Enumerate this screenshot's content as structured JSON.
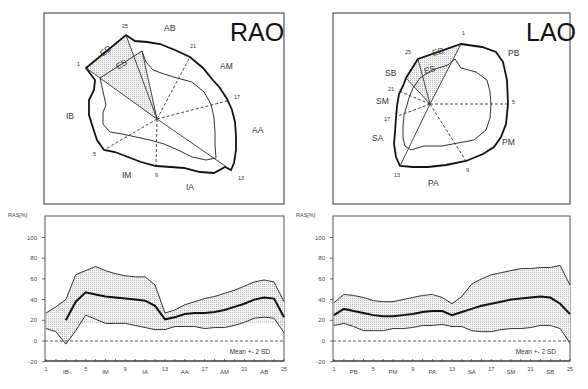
{
  "panels": {
    "rao": {
      "title": "RAO",
      "regions": [
        {
          "label": "AB",
          "x": 164,
          "y": 31
        },
        {
          "label": "AM",
          "x": 220,
          "y": 69
        },
        {
          "label": "AA",
          "x": 252,
          "y": 133
        },
        {
          "label": "IA",
          "x": 186,
          "y": 190
        },
        {
          "label": "IM",
          "x": 122,
          "y": 178
        },
        {
          "label": "IB",
          "x": 66,
          "y": 119
        }
      ],
      "point_labels": [
        {
          "label": "25",
          "x": 122,
          "y": 28
        },
        {
          "label": "21",
          "x": 190,
          "y": 48
        },
        {
          "label": "17",
          "x": 234,
          "y": 99
        },
        {
          "label": "13",
          "x": 238,
          "y": 180
        },
        {
          "label": "9",
          "x": 155,
          "y": 177
        },
        {
          "label": "5",
          "x": 93,
          "y": 156
        },
        {
          "label": "1",
          "x": 77,
          "y": 66
        }
      ],
      "ed_label": "ED",
      "es_label": "ES"
    },
    "lao": {
      "title": "LAO",
      "regions": [
        {
          "label": "PB",
          "x": 508,
          "y": 56
        },
        {
          "label": "PM",
          "x": 502,
          "y": 145
        },
        {
          "label": "PA",
          "x": 428,
          "y": 186
        },
        {
          "label": "SA",
          "x": 372,
          "y": 141
        },
        {
          "label": "SM",
          "x": 376,
          "y": 104
        },
        {
          "label": "SB",
          "x": 385,
          "y": 76
        }
      ],
      "point_labels": [
        {
          "label": "1",
          "x": 462,
          "y": 35
        },
        {
          "label": "25",
          "x": 405,
          "y": 54
        },
        {
          "label": "21",
          "x": 388,
          "y": 91
        },
        {
          "label": "17",
          "x": 384,
          "y": 121
        },
        {
          "label": "13",
          "x": 394,
          "y": 177
        },
        {
          "label": "9",
          "x": 466,
          "y": 172
        },
        {
          "label": "5",
          "x": 512,
          "y": 104
        }
      ],
      "ed_label": "ED",
      "es_label": "ES"
    }
  },
  "chart_data": [
    {
      "type": "area",
      "title": "RAO",
      "ylabel": "RAS[%]",
      "xlabel": "",
      "x": [
        1,
        2,
        3,
        4,
        5,
        6,
        7,
        8,
        9,
        10,
        11,
        12,
        13,
        14,
        15,
        16,
        17,
        18,
        19,
        20,
        21,
        22,
        23,
        24,
        25
      ],
      "x_tick_labels": [
        "1",
        "5",
        "9",
        "13",
        "17",
        "21",
        "25"
      ],
      "x_region_labels": [
        "IB",
        "IM",
        "IA",
        "AA",
        "AM",
        "AB"
      ],
      "ylim": [
        -20,
        100
      ],
      "y_ticks": [
        100,
        80,
        60,
        40,
        20,
        0,
        -20
      ],
      "reference_line": 0,
      "legend": "Mean +- 2 SD",
      "series": [
        {
          "name": "Mean + 2 SD",
          "values": [
            27,
            33,
            40,
            64,
            68,
            72,
            68,
            65,
            63,
            62,
            62,
            54,
            27,
            30,
            35,
            38,
            41,
            43,
            46,
            49,
            53,
            57,
            59,
            57,
            38
          ]
        },
        {
          "name": "Mean",
          "values": [
            null,
            null,
            20,
            38,
            47,
            45,
            43,
            42,
            41,
            40,
            39,
            34,
            21,
            23,
            26,
            27,
            27,
            28,
            30,
            33,
            36,
            40,
            42,
            41,
            23
          ]
        },
        {
          "name": "Mean - 2 SD",
          "values": [
            12,
            9,
            -3,
            10,
            25,
            21,
            17,
            17,
            17,
            15,
            13,
            11,
            11,
            14,
            14,
            14,
            12,
            13,
            13,
            15,
            18,
            22,
            23,
            22,
            8
          ]
        }
      ]
    },
    {
      "type": "area",
      "title": "LAO",
      "ylabel": "RAS[%]",
      "xlabel": "",
      "x": [
        1,
        2,
        3,
        4,
        5,
        6,
        7,
        8,
        9,
        10,
        11,
        12,
        13,
        14,
        15,
        16,
        17,
        18,
        19,
        20,
        21,
        22,
        23,
        24,
        25
      ],
      "x_tick_labels": [
        "1",
        "5",
        "9",
        "13",
        "17",
        "21",
        "25"
      ],
      "x_region_labels": [
        "PB",
        "PM",
        "PA",
        "SA",
        "SM",
        "SB"
      ],
      "ylim": [
        -20,
        100
      ],
      "y_ticks": [
        100,
        80,
        60,
        40,
        20,
        0,
        -20
      ],
      "reference_line": 0,
      "legend": "Mean +- 2 SD",
      "series": [
        {
          "name": "Mean + 2 SD",
          "values": [
            37,
            45,
            44,
            42,
            39,
            38,
            38,
            40,
            42,
            44,
            45,
            42,
            36,
            43,
            55,
            60,
            64,
            66,
            68,
            70,
            70,
            71,
            71,
            73,
            54
          ]
        },
        {
          "name": "Mean",
          "values": [
            25,
            31,
            29,
            27,
            25,
            24,
            24,
            25,
            26,
            28,
            29,
            29,
            25,
            28,
            31,
            34,
            36,
            38,
            40,
            41,
            42,
            43,
            42,
            36,
            26
          ]
        },
        {
          "name": "Mean - 2 SD",
          "values": [
            15,
            17,
            14,
            10,
            10,
            10,
            12,
            12,
            13,
            15,
            15,
            16,
            14,
            14,
            10,
            9,
            9,
            11,
            12,
            12,
            13,
            15,
            15,
            12,
            -2
          ]
        }
      ]
    }
  ]
}
